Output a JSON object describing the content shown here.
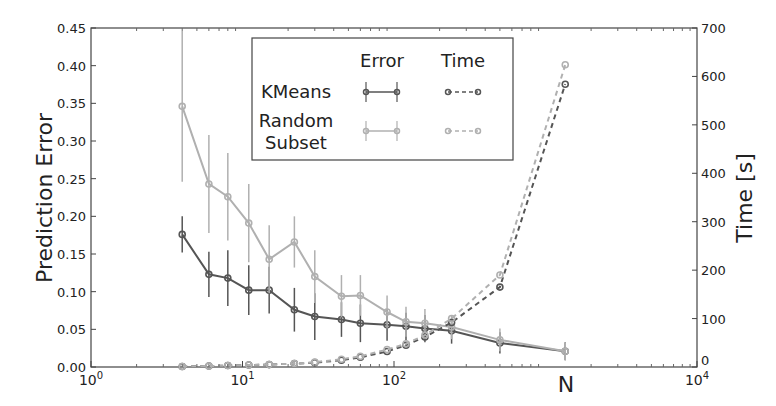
{
  "chart_data": {
    "type": "line",
    "title": "",
    "xlabel": "N",
    "ylabel": "Prediction Error",
    "y2label": "Time [s]",
    "xscale": "log",
    "xlim": [
      1,
      10000
    ],
    "ylim": [
      0,
      0.45
    ],
    "y2lim": [
      0,
      700
    ],
    "xticks": [
      "10^0",
      "10^1",
      "10^2",
      "10^4"
    ],
    "xtick_labels": [
      {
        "base": "10",
        "exp": "0"
      },
      {
        "base": "10",
        "exp": "1"
      },
      {
        "base": "10",
        "exp": "2"
      },
      {
        "base": "10",
        "exp": "4"
      }
    ],
    "yticks": [
      "0.00",
      "0.05",
      "0.10",
      "0.15",
      "0.20",
      "0.25",
      "0.30",
      "0.35",
      "0.40",
      "0.45"
    ],
    "y2ticks": [
      "0",
      "100",
      "200",
      "300",
      "400",
      "500",
      "600",
      "700"
    ],
    "grid": false,
    "legend": {
      "position": "upper center",
      "col_headers": [
        "Error",
        "Time"
      ],
      "row_labels": [
        "KMeans",
        "Random\nSubset"
      ],
      "row_label_lines": [
        [
          "KMeans"
        ],
        [
          "Random",
          "Subset"
        ]
      ]
    },
    "x": [
      4,
      6,
      8,
      11,
      15,
      22,
      30,
      45,
      60,
      90,
      120,
      160,
      240,
      500,
      1350
    ],
    "series": [
      {
        "name": "KMeans Error",
        "axis": "left",
        "style": "solid",
        "color": "#555555",
        "values": [
          0.176,
          0.123,
          0.118,
          0.102,
          0.102,
          0.076,
          0.067,
          0.063,
          0.058,
          0.056,
          0.054,
          0.051,
          0.048,
          0.032,
          0.021
        ],
        "errors": [
          0.024,
          0.03,
          0.037,
          0.033,
          0.031,
          0.029,
          0.031,
          0.023,
          0.025,
          0.021,
          0.018,
          0.018,
          0.017,
          0.014,
          0.012
        ]
      },
      {
        "name": "Random Subset Error",
        "axis": "left",
        "style": "solid",
        "color": "#b0b0b0",
        "values": [
          0.346,
          0.243,
          0.226,
          0.191,
          0.143,
          0.166,
          0.12,
          0.094,
          0.095,
          0.073,
          0.06,
          0.058,
          0.053,
          0.036,
          0.021
        ],
        "errors": [
          0.1,
          0.065,
          0.058,
          0.052,
          0.045,
          0.034,
          0.035,
          0.028,
          0.027,
          0.022,
          0.02,
          0.019,
          0.016,
          0.015,
          0.012
        ]
      },
      {
        "name": "KMeans Time",
        "axis": "right",
        "style": "dashed",
        "color": "#555555",
        "values": [
          1,
          2,
          3,
          4,
          5,
          7,
          9,
          14,
          20,
          32,
          45,
          62,
          92,
          165,
          584
        ]
      },
      {
        "name": "Random Subset Time",
        "axis": "right",
        "style": "dashed",
        "color": "#b0b0b0",
        "values": [
          1,
          2,
          3,
          4,
          5,
          7,
          10,
          16,
          22,
          36,
          48,
          66,
          100,
          190,
          624
        ]
      }
    ]
  }
}
